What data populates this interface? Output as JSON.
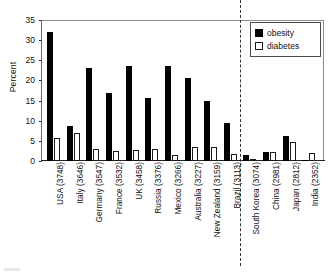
{
  "chart_data": {
    "type": "bar",
    "title": "",
    "subtitle": "",
    "xlabel": "",
    "ylabel": "Percent",
    "ylim": [
      0,
      35
    ],
    "yticks": [
      0,
      5,
      10,
      15,
      20,
      25,
      30,
      35
    ],
    "grid": false,
    "legend_position": "top-right",
    "categories": [
      "USA (3748)",
      "Italy (3646)",
      "Germany (3547)",
      "France (3532)",
      "UK (3458)",
      "Russia (3376)",
      "Mexico (3266)",
      "Australia (3227)",
      "New Zealand (3159)",
      "Brazil (3113)",
      "South Korea (3074)",
      "China (2981)",
      "Japan (2812)",
      "India (2352)"
    ],
    "series": [
      {
        "name": "obesity",
        "color": "#000000",
        "values": [
          32.0,
          8.8,
          23.0,
          16.8,
          23.7,
          15.7,
          23.6,
          20.6,
          15.0,
          9.4,
          1.4,
          2.3,
          6.1,
          0.3
        ]
      },
      {
        "name": "diabetes",
        "color": "#ffffff",
        "values": [
          5.8,
          7.0,
          3.1,
          2.5,
          2.7,
          3.0,
          1.5,
          3.6,
          3.6,
          1.8,
          0.4,
          2.2,
          4.6,
          1.9
        ]
      }
    ],
    "annotations": [
      {
        "name": "region-divider",
        "type": "vertical-dashed-line",
        "after_category": "Brazil (3113)"
      }
    ]
  },
  "legend": {
    "items": [
      {
        "label": "obesity",
        "swatch": "solid-black-square-icon"
      },
      {
        "label": "diabetes",
        "swatch": "dotted-square-icon"
      }
    ]
  },
  "axis": {
    "y_title": "Percent",
    "y_tick_labels": [
      "35",
      "30",
      "25",
      "20",
      "15",
      "10",
      "5",
      "0"
    ]
  }
}
